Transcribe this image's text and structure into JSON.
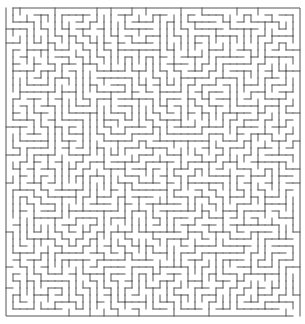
{
  "title": "Maze",
  "maze": {
    "cols": 42,
    "rows": 44,
    "cell_size": 7.0,
    "origin_x": 6,
    "origin_y": 8,
    "wall_color": "#555555",
    "background": "#ffffff",
    "wall_width": 1,
    "seed": 7331
  }
}
